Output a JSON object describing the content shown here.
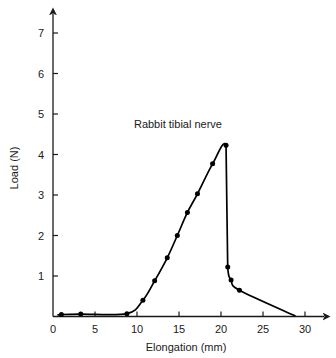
{
  "chart_data": {
    "type": "line",
    "title": "",
    "annotation": "Rabbit tibial nerve",
    "xlabel": "Elongation (mm)",
    "ylabel": "Load (N)",
    "xlim": [
      0,
      33
    ],
    "ylim": [
      0,
      7.4
    ],
    "xticks": [
      0,
      5,
      10,
      15,
      20,
      25,
      30
    ],
    "xtick_labels": [
      "0",
      "5",
      "10",
      "15",
      "20",
      "25",
      "30"
    ],
    "yticks": [
      1,
      2,
      3,
      4,
      5,
      6,
      7
    ],
    "ytick_labels": [
      "1",
      "2",
      "3",
      "4",
      "5",
      "6",
      "7"
    ],
    "grid": false,
    "legend": "none",
    "series": [
      {
        "name": "Rabbit tibial nerve",
        "marker": "filled-circle",
        "color": "#000000",
        "x": [
          0.6,
          1.0,
          3.3,
          8.8,
          10.7,
          12.1,
          13.6,
          14.8,
          16.0,
          17.2,
          19.0,
          20.6,
          20.7,
          20.8,
          21.2,
          22.2,
          28.8
        ],
        "y": [
          0.04,
          0.05,
          0.06,
          0.07,
          0.4,
          0.88,
          1.45,
          2.0,
          2.57,
          3.03,
          3.77,
          4.23,
          2.7,
          1.22,
          0.9,
          0.65,
          0.02
        ],
        "marker_x": [
          1.0,
          3.3,
          8.8,
          10.7,
          12.1,
          13.6,
          14.8,
          16.0,
          17.2,
          19.0,
          20.6,
          20.8,
          21.2,
          22.2
        ],
        "marker_y": [
          0.05,
          0.06,
          0.07,
          0.4,
          0.88,
          1.45,
          2.0,
          2.57,
          3.03,
          3.77,
          4.23,
          1.22,
          0.9,
          0.65
        ],
        "peak": {
          "x": 20.6,
          "y": 4.23
        },
        "failure_drop": {
          "from_y": 4.23,
          "to_y": 1.22,
          "at_x": 20.7
        }
      }
    ]
  }
}
